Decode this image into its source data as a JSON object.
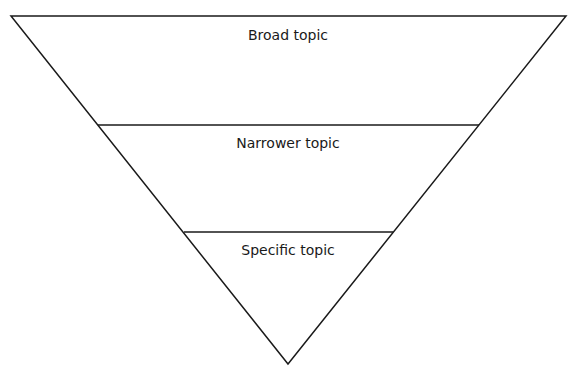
{
  "diagram": {
    "type": "inverted-funnel",
    "stroke_color": "#1a1a1a",
    "fill_color": "#ffffff",
    "text_color": "#1a1a1a",
    "levels": [
      {
        "label": "Broad topic"
      },
      {
        "label": "Narrower topic"
      },
      {
        "label": "Specific topic"
      }
    ]
  }
}
